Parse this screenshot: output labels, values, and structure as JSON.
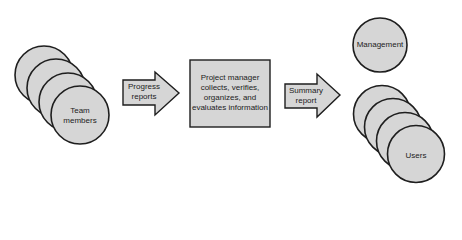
{
  "colors": {
    "fill": "#d6d6d6",
    "stroke": "#1e1e1e",
    "text": "#222222",
    "background": "#ffffff"
  },
  "nodes": {
    "team_members": {
      "label_line1": "Team",
      "label_line2": "members",
      "shape": "stacked-circles",
      "count": 4
    },
    "progress_reports": {
      "label_line1": "Progress",
      "label_line2": "reports",
      "shape": "block-arrow"
    },
    "project_manager": {
      "lines": [
        "Project manager",
        "collects, verifies,",
        "organizes, and",
        "evaluates information"
      ],
      "shape": "rectangle"
    },
    "summary_report": {
      "label_line1": "Summary",
      "label_line2": "report",
      "shape": "block-arrow"
    },
    "management": {
      "label": "Management",
      "shape": "circle"
    },
    "users": {
      "label": "Users",
      "shape": "stacked-circles",
      "count": 4
    }
  },
  "flow": [
    "Team members",
    "Progress reports",
    "Project manager collects, verifies, organizes, and evaluates information",
    "Summary report",
    "Management / Users"
  ]
}
